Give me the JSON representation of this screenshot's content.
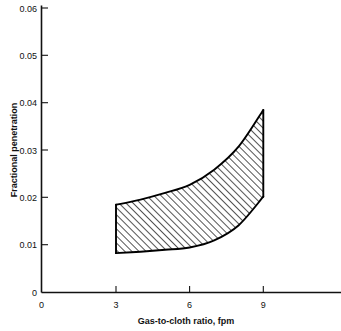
{
  "chart_data": {
    "type": "area",
    "title": "",
    "subtitle": "",
    "xlabel": "Gas-to-cloth ratio, fpm",
    "ylabel": "Fractional penetration",
    "xlim": [
      0,
      13.8
    ],
    "ylim": [
      0,
      0.06
    ],
    "grid": false,
    "legend": "none",
    "xticks": [
      "0",
      "3",
      "6",
      "9"
    ],
    "xtick_values": [
      0,
      3,
      6,
      9
    ],
    "yticks": [
      "0",
      "0.01",
      "0.02",
      "0.03",
      "0.04",
      "0.05",
      "0.06"
    ],
    "ytick_values": [
      0,
      0.01,
      0.02,
      0.03,
      0.04,
      0.05,
      0.06
    ],
    "annotations": [],
    "band": {
      "name": "Fractional penetration range (hatched band)",
      "fill": "hatch-diagonal",
      "outline_color": "#000000",
      "x": [
        3,
        4,
        5,
        6,
        7,
        8,
        9
      ],
      "upper": [
        0.0185,
        0.0196,
        0.021,
        0.0227,
        0.0259,
        0.0308,
        0.0385
      ],
      "lower": [
        0.0083,
        0.0086,
        0.009,
        0.0095,
        0.011,
        0.0142,
        0.0202
      ]
    }
  },
  "axes": {
    "y_title": "Fractional penetration",
    "x_title": "Gas-to-cloth ratio, fpm",
    "y_tick_labels": [
      "0.06",
      "0.05",
      "0.04",
      "0.03",
      "0.02",
      "0.01",
      "0"
    ],
    "x_tick_labels": [
      "0",
      "3",
      "6",
      "9"
    ]
  },
  "colors": {
    "ink": "#111111",
    "background": "#ffffff",
    "band_outline": "#000000",
    "hatch": "#1a1a1a"
  }
}
